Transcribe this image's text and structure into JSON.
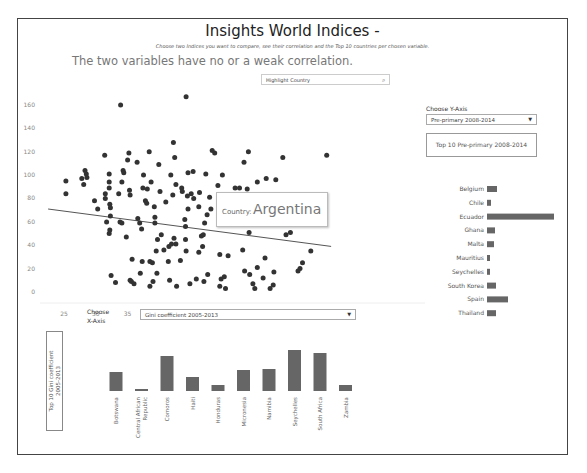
{
  "header": {
    "title": "Insights World Indices -",
    "subtitle": "Choose two Indices you want to compare, see their correlation and the Top 10 countries per chosen variable.",
    "correlation_text": "The two variables have no or a weak correlation."
  },
  "search": {
    "placeholder": "Highlight Country",
    "icon": "search-icon"
  },
  "tooltip": {
    "label": "Country:",
    "value": "Argentina"
  },
  "y_axis_control": {
    "label": "Choose Y-Axis",
    "selected": "Pre-primary 2008-2014",
    "top10_title": "Top 10 Pre-primary 2008-2014"
  },
  "x_axis_control": {
    "label_line1": "Choose",
    "label_line2": "X-Axis",
    "selected": "Gini coefficient 2005-2013",
    "top10_title": "Top 10 Gini coefficient\n2005-2013"
  },
  "chart_data": [
    {
      "type": "scatter",
      "title": "Gini coefficient 2005-2013 vs Pre-primary 2008-2014",
      "xlabel": "Gini coefficient 2005-2013",
      "ylabel": "Pre-primary 2008-2014",
      "xlim": [
        22,
        67
      ],
      "ylim": [
        -5,
        170
      ],
      "x_ticks": [
        25,
        30,
        35,
        40,
        45,
        50,
        55,
        60,
        65
      ],
      "y_ticks": [
        0,
        20,
        40,
        60,
        80,
        100,
        120,
        140,
        160
      ],
      "grid": false,
      "trend_line": {
        "x": [
          22.5,
          67
        ],
        "y": [
          71,
          39
        ]
      },
      "highlight": {
        "label": "Argentina"
      },
      "points": [
        [
          25.3,
          95
        ],
        [
          25.3,
          84
        ],
        [
          27.8,
          97
        ],
        [
          28.3,
          104
        ],
        [
          28.5,
          101
        ],
        [
          28.6,
          98
        ],
        [
          28.1,
          92
        ],
        [
          29.8,
          78
        ],
        [
          30.3,
          71
        ],
        [
          31.4,
          117
        ],
        [
          31.5,
          84
        ],
        [
          31.5,
          80
        ],
        [
          31.7,
          60
        ],
        [
          32.1,
          101
        ],
        [
          32.1,
          94
        ],
        [
          32.1,
          89
        ],
        [
          32.2,
          75
        ],
        [
          32.3,
          72
        ],
        [
          32.3,
          65
        ],
        [
          32.2,
          53
        ],
        [
          32.1,
          50
        ],
        [
          32.4,
          14
        ],
        [
          33.1,
          8
        ],
        [
          33.6,
          84
        ],
        [
          33.8,
          60
        ],
        [
          34.1,
          59
        ],
        [
          34.1,
          94
        ],
        [
          34.3,
          104
        ],
        [
          34.4,
          102
        ],
        [
          34.8,
          47
        ],
        [
          35.0,
          113
        ],
        [
          35.2,
          119
        ],
        [
          35.3,
          87
        ],
        [
          35.4,
          83
        ],
        [
          35.4,
          10
        ],
        [
          35.6,
          9
        ],
        [
          35.7,
          28
        ],
        [
          36.0,
          7
        ],
        [
          36.5,
          111
        ],
        [
          37.0,
          16
        ],
        [
          37.2,
          54
        ],
        [
          37.3,
          26
        ],
        [
          37.4,
          89
        ],
        [
          37.5,
          100
        ],
        [
          37.8,
          78
        ],
        [
          38.0,
          76
        ],
        [
          38.1,
          88
        ],
        [
          38.4,
          120
        ],
        [
          38.5,
          5
        ],
        [
          38.5,
          26
        ],
        [
          38.7,
          94
        ],
        [
          38.9,
          25
        ],
        [
          39.0,
          9
        ],
        [
          39.2,
          73
        ],
        [
          39.3,
          64
        ],
        [
          39.3,
          59
        ],
        [
          39.5,
          35
        ],
        [
          39.6,
          16
        ],
        [
          39.7,
          45
        ],
        [
          39.9,
          109
        ],
        [
          40.1,
          86
        ],
        [
          40.3,
          49
        ],
        [
          40.7,
          36
        ],
        [
          41.0,
          77
        ],
        [
          41.4,
          26
        ],
        [
          41.5,
          39
        ],
        [
          41.6,
          10
        ],
        [
          41.8,
          100
        ],
        [
          42.1,
          83
        ],
        [
          42.2,
          128
        ],
        [
          42.4,
          115
        ],
        [
          42.6,
          41
        ],
        [
          42.6,
          92
        ],
        [
          42.7,
          5
        ],
        [
          43.3,
          27
        ],
        [
          43.5,
          89
        ],
        [
          43.6,
          86
        ],
        [
          44.0,
          62
        ],
        [
          44.1,
          56
        ],
        [
          44.1,
          45
        ],
        [
          44.2,
          35
        ],
        [
          44.5,
          102
        ],
        [
          44.5,
          71
        ],
        [
          44.8,
          7
        ],
        [
          45.0,
          84
        ],
        [
          45.3,
          103
        ],
        [
          45.8,
          11
        ],
        [
          46.2,
          34
        ],
        [
          46.3,
          85
        ],
        [
          46.6,
          48
        ],
        [
          46.8,
          39
        ],
        [
          46.9,
          49
        ],
        [
          47.0,
          9
        ],
        [
          47.3,
          101
        ],
        [
          47.5,
          66
        ],
        [
          47.6,
          15
        ],
        [
          47.9,
          81
        ],
        [
          48.1,
          71
        ],
        [
          48.7,
          119
        ],
        [
          49.2,
          91
        ],
        [
          49.5,
          5
        ],
        [
          49.5,
          32
        ],
        [
          49.7,
          11
        ],
        [
          49.9,
          100
        ],
        [
          50.2,
          13
        ],
        [
          50.4,
          3
        ],
        [
          50.8,
          31
        ],
        [
          51.2,
          63
        ],
        [
          51.4,
          75
        ],
        [
          51.6,
          59
        ],
        [
          51.9,
          89
        ],
        [
          52.5,
          63
        ],
        [
          52.6,
          89
        ],
        [
          53.1,
          36
        ],
        [
          53.4,
          18
        ],
        [
          53.8,
          88
        ],
        [
          54.0,
          120
        ],
        [
          54.0,
          80
        ],
        [
          54.1,
          51
        ],
        [
          54.2,
          15
        ],
        [
          54.7,
          7
        ],
        [
          55.0,
          3
        ],
        [
          55.0,
          78
        ],
        [
          55.4,
          21
        ],
        [
          55.6,
          78
        ],
        [
          56.3,
          12
        ],
        [
          56.6,
          29
        ],
        [
          56.8,
          97
        ],
        [
          57.1,
          83
        ],
        [
          57.4,
          3
        ],
        [
          57.7,
          77
        ],
        [
          57.9,
          6
        ],
        [
          58.0,
          17
        ],
        [
          58.3,
          96
        ],
        [
          33.9,
          160
        ],
        [
          44.2,
          167
        ],
        [
          48.3,
          121
        ],
        [
          53.3,
          111
        ],
        [
          55.4,
          94
        ],
        [
          59.9,
          49
        ],
        [
          62.1,
          20
        ],
        [
          62.5,
          25
        ],
        [
          61.8,
          18
        ],
        [
          65.2,
          71
        ],
        [
          66.3,
          117
        ],
        [
          60.6,
          51
        ],
        [
          59.4,
          115
        ],
        [
          63.8,
          35
        ],
        [
          50.1,
          67
        ],
        [
          52.9,
          73
        ],
        [
          53.8,
          72
        ],
        [
          44.4,
          82
        ],
        [
          45.4,
          80
        ],
        [
          46.2,
          73
        ],
        [
          47.1,
          59
        ],
        [
          36.6,
          63
        ],
        [
          36.9,
          59
        ],
        [
          41.9,
          41
        ],
        [
          42.3,
          46
        ]
      ]
    },
    {
      "type": "bar",
      "orientation": "horizontal",
      "title": "Top 10 Pre-primary 2008-2014",
      "categories": [
        "Belgium",
        "Chile",
        "Ecuador",
        "Ghana",
        "Malta",
        "Mauritius",
        "Seychelles",
        "South Korea",
        "Spain",
        "Thailand"
      ],
      "values": [
        118,
        102,
        167,
        115,
        115,
        104,
        104,
        118,
        127,
        117
      ],
      "bar_lengths_px": [
        10,
        4,
        67,
        8,
        7,
        3,
        3,
        9,
        21,
        9
      ]
    },
    {
      "type": "bar",
      "orientation": "vertical",
      "title": "Top 10 Gini coefficient 2005-2013",
      "categories": [
        "Botswana",
        "Central African Republic",
        "Comoros",
        "Haiti",
        "Honduras",
        "Micronesia",
        "Namibia",
        "Seychelles",
        "South Africa",
        "Zambia"
      ],
      "values": [
        60.5,
        56.3,
        64.3,
        59.2,
        57.0,
        61.1,
        61.3,
        65.8,
        65.0,
        57.5
      ],
      "bar_heights_px": [
        19,
        2,
        35,
        14,
        6,
        21,
        22,
        41,
        38,
        6
      ]
    }
  ]
}
